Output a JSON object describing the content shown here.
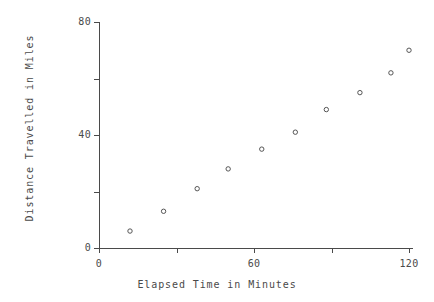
{
  "figure": {
    "width": 434,
    "height": 302,
    "background": "#ffffff",
    "foreground": "#4a4a4a"
  },
  "chart_data": {
    "type": "scatter",
    "title": "",
    "xlabel": "Elapsed Time in Minutes",
    "ylabel": "Distance Travelled in Miles",
    "xlim": [
      0,
      127
    ],
    "ylim": [
      0,
      82
    ],
    "grid": false,
    "legend": null,
    "marker": "open-circle",
    "marker_color": "#555555",
    "x": [
      12,
      25,
      38,
      50,
      63,
      76,
      88,
      101,
      113,
      120
    ],
    "y": [
      6,
      13,
      21,
      28,
      35,
      41,
      49,
      55,
      62,
      70
    ],
    "points": [
      {
        "x": 12,
        "y": 6
      },
      {
        "x": 25,
        "y": 13
      },
      {
        "x": 38,
        "y": 21
      },
      {
        "x": 50,
        "y": 28
      },
      {
        "x": 63,
        "y": 35
      },
      {
        "x": 76,
        "y": 41
      },
      {
        "x": 88,
        "y": 49
      },
      {
        "x": 101,
        "y": 55
      },
      {
        "x": 113,
        "y": 62
      },
      {
        "x": 120,
        "y": 70
      }
    ],
    "xticks": [
      {
        "value": 0,
        "label": "0"
      },
      {
        "value": 30,
        "label": ""
      },
      {
        "value": 60,
        "label": "60"
      },
      {
        "value": 90,
        "label": ""
      },
      {
        "value": 120,
        "label": "120"
      }
    ],
    "yticks": [
      {
        "value": 0,
        "label": "0"
      },
      {
        "value": 20,
        "label": ""
      },
      {
        "value": 40,
        "label": "40"
      },
      {
        "value": 60,
        "label": ""
      },
      {
        "value": 80,
        "label": "80"
      }
    ]
  }
}
